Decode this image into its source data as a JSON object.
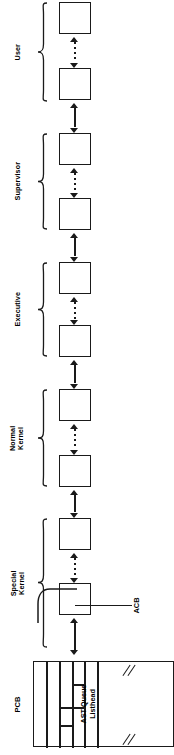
{
  "diagram": {
    "orientation": "rotated-90-ccw",
    "line_color": "#1a1a1a",
    "background": "#ffffff",
    "pcb": {
      "label": "PCB",
      "ast_queue_label_line1": "AST Queue",
      "ast_queue_label_line2": "Listhead",
      "break_mark": "//"
    },
    "callout": {
      "label": "ACB"
    },
    "groups": [
      {
        "label": "User",
        "label_line1": "User",
        "label_line2": "",
        "boxes": 2
      },
      {
        "label": "Supervisor",
        "label_line1": "Supervisor",
        "label_line2": "",
        "boxes": 2
      },
      {
        "label": "Executive",
        "label_line1": "Executive",
        "label_line2": "",
        "boxes": 2
      },
      {
        "label": "Normal Kernel",
        "label_line1": "Normal",
        "label_line2": "Kernel",
        "boxes": 2
      },
      {
        "label": "Special Kernel",
        "label_line1": "Special",
        "label_line2": "Kernel",
        "boxes": 2
      }
    ],
    "boxes": [
      {
        "name": "acb-user-2",
        "group": "User"
      },
      {
        "name": "acb-user-1",
        "group": "User"
      },
      {
        "name": "acb-supervisor-2",
        "group": "Supervisor"
      },
      {
        "name": "acb-supervisor-1",
        "group": "Supervisor"
      },
      {
        "name": "acb-executive-2",
        "group": "Executive"
      },
      {
        "name": "acb-executive-1",
        "group": "Executive"
      },
      {
        "name": "acb-normal-kernel-2",
        "group": "Normal Kernel"
      },
      {
        "name": "acb-normal-kernel-1",
        "group": "Normal Kernel"
      },
      {
        "name": "acb-special-kernel-2",
        "group": "Special Kernel"
      },
      {
        "name": "acb-special-kernel-1",
        "group": "Special Kernel"
      }
    ]
  }
}
